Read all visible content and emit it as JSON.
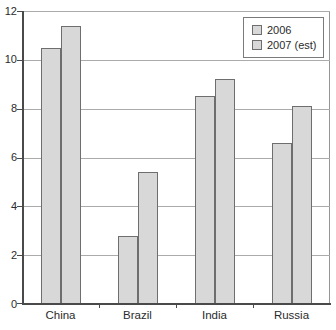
{
  "chart_data": {
    "type": "bar",
    "title": "",
    "xlabel": "",
    "ylabel": "",
    "categories": [
      "China",
      "Brazil",
      "India",
      "Russia"
    ],
    "series": [
      {
        "name": "2006",
        "values": [
          10.5,
          2.8,
          8.5,
          6.6
        ]
      },
      {
        "name": "2007 (est)",
        "values": [
          11.4,
          5.4,
          9.2,
          8.1
        ]
      }
    ],
    "ylim": [
      0,
      12
    ],
    "yticks": [
      0,
      2,
      4,
      6,
      8,
      10,
      12
    ],
    "grid": true,
    "grouped": true,
    "legend_position": "top-right"
  },
  "legend": {
    "items": [
      "2006",
      "2007 (est)"
    ]
  },
  "colors": {
    "background": "#ffffff",
    "bar_fill": "#d8d8d8",
    "bar_border": "#6e6e6e",
    "gridline": "#ababab",
    "axis": "#4a4a4a",
    "plot_border": "#959595",
    "legend_border": "#7a7a7a",
    "text": "#2b2b2b"
  }
}
